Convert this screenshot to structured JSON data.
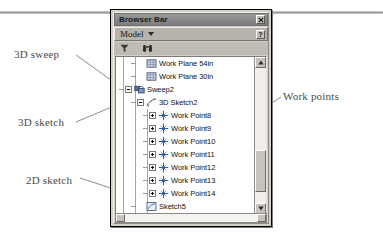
{
  "window": {
    "title": "Browser Bar",
    "close_icon": "close-x-icon",
    "help_icon": "help-question-icon"
  },
  "selector": {
    "label": "Model",
    "caret_icon": "chevron-down-icon"
  },
  "toolbar": {
    "filter_icon": "filter-funnel-icon",
    "find_icon": "binoculars-find-icon"
  },
  "tree": {
    "items": [
      {
        "label": "Work Plane 54in",
        "icon": "work-plane-icon",
        "depth": 1,
        "expander": "none"
      },
      {
        "label": "Work Plane 30in",
        "icon": "work-plane-icon",
        "depth": 1,
        "expander": "none"
      },
      {
        "label": "Sweep2",
        "icon": "sweep-icon",
        "depth": 0,
        "expander": "minus"
      },
      {
        "label": "3D Sketch2",
        "icon": "sketch-3d-icon",
        "depth": 1,
        "expander": "minus"
      },
      {
        "label": "Work Point8",
        "icon": "work-point-icon",
        "depth": 2,
        "expander": "plus"
      },
      {
        "label": "Work Point9",
        "icon": "work-point-icon",
        "depth": 2,
        "expander": "plus"
      },
      {
        "label": "Work Point10",
        "icon": "work-point-icon",
        "depth": 2,
        "expander": "plus"
      },
      {
        "label": "Work Point11",
        "icon": "work-point-icon",
        "depth": 2,
        "expander": "plus"
      },
      {
        "label": "Work Point12",
        "icon": "work-point-icon",
        "depth": 2,
        "expander": "plus"
      },
      {
        "label": "Work Point13",
        "icon": "work-point-icon",
        "depth": 2,
        "expander": "plus"
      },
      {
        "label": "Work Point14",
        "icon": "work-point-icon",
        "depth": 2,
        "expander": "plus"
      },
      {
        "label": "Sketch5",
        "icon": "sketch-2d-icon",
        "depth": 1,
        "expander": "none"
      },
      {
        "label": "End of Part",
        "icon": "end-of-part-icon",
        "depth": 0,
        "expander": "none"
      }
    ]
  },
  "scrollbars": {
    "up_arrow_icon": "scroll-up-arrow-icon",
    "down_arrow_icon": "scroll-down-arrow-icon",
    "left_arrow_icon": "scroll-left-arrow-icon",
    "right_arrow_icon": "scroll-right-arrow-icon"
  },
  "annotations": [
    {
      "id": "3d-sweep",
      "text": "3D sweep"
    },
    {
      "id": "3d-sketch",
      "text": "3D sketch"
    },
    {
      "id": "2d-sketch",
      "text": "2D sketch"
    },
    {
      "id": "work-points",
      "text": "Work points"
    }
  ],
  "colors": {
    "annotation_text": "#4a4a4a",
    "window_face": "#d4d0c8",
    "titlebar": "#8b8b8b",
    "tree_background": "#ffffff",
    "tree_line": "#a6a6a6"
  }
}
